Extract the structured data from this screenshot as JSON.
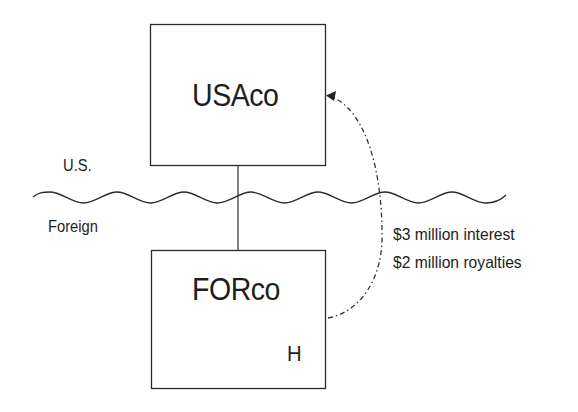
{
  "diagram": {
    "entities": [
      {
        "id": "usaco",
        "label": "USAco",
        "jurisdiction": "U.S."
      },
      {
        "id": "forco",
        "label": "FORco",
        "jurisdiction": "Foreign",
        "marker": "H"
      }
    ],
    "regions": {
      "upper": "U.S.",
      "lower": "Foreign"
    },
    "ownership_link": {
      "from": "USAco",
      "to": "FORco"
    },
    "payment_flow": {
      "from": "FORco",
      "to": "USAco",
      "style": "dash-dot",
      "lines": [
        "$3 million interest",
        "$2 million royalties"
      ]
    },
    "colors": {
      "line": "#2a2a2a",
      "text": "#1e1e1e",
      "background": "#ffffff"
    }
  }
}
